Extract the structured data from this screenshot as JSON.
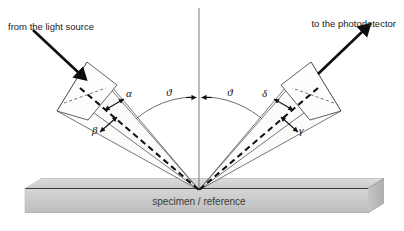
{
  "figure": {
    "canvas": {
      "width": 404,
      "height": 231
    },
    "background_color": "#ffffff"
  },
  "annotations": {
    "source_label": "from the light source",
    "detector_label": "to the photodetector",
    "substrate_label": "specimen / reference"
  },
  "angles": [
    {
      "name": "theta-incident",
      "symbol": "ϑ",
      "side": "left",
      "meaning": "angle of incidence from surface normal"
    },
    {
      "name": "theta-reflected",
      "symbol": "ϑ",
      "side": "right",
      "meaning": "angle of reflection from surface normal"
    },
    {
      "name": "alpha",
      "symbol": "α",
      "side": "left",
      "meaning": "upper divergence half-angle of incident beam"
    },
    {
      "name": "beta",
      "symbol": "β",
      "side": "left",
      "meaning": "lower divergence half-angle of incident beam"
    },
    {
      "name": "delta",
      "symbol": "δ",
      "side": "right",
      "meaning": "upper acceptance half-angle of detector"
    },
    {
      "name": "gamma",
      "symbol": "γ",
      "side": "right",
      "meaning": "lower acceptance half-angle of detector"
    }
  ],
  "colors": {
    "ink": "#111111",
    "line": "#4a4a4a",
    "slab_top": "#d3d3d3",
    "slab_front": "#c2c2c2",
    "slab_bevel": "#b4b4b4",
    "beam_fill": "#fbfbfb",
    "text": "#1a1a1a"
  },
  "geometry": {
    "incidence_point": {
      "x": 199,
      "y": 190
    },
    "normal_top": {
      "x": 199,
      "y": 8
    },
    "arc_radius": 93
  }
}
